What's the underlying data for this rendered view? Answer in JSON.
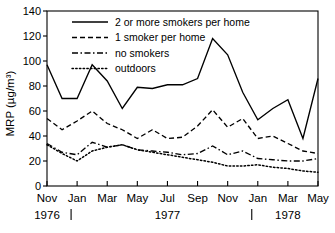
{
  "chart_data": {
    "type": "line",
    "title": "",
    "xlabel": "",
    "ylabel": "MRP (µg/m³)",
    "ylim": [
      0,
      140
    ],
    "yticks": [
      0,
      20,
      40,
      60,
      80,
      100,
      120,
      140
    ],
    "grid": false,
    "legend_position": "top-center",
    "x_month_index_range": [
      0,
      18
    ],
    "x_tick_labels": [
      "Nov",
      "Jan",
      "Mar",
      "May",
      "Jul",
      "Sep",
      "Nov",
      "Jan",
      "Mar",
      "May"
    ],
    "x_tick_month_index": [
      0,
      2,
      4,
      6,
      8,
      10,
      12,
      14,
      16,
      18
    ],
    "year_labels": [
      {
        "text": "1976",
        "month_index": 0
      },
      {
        "text": "1977",
        "month_index": 8
      },
      {
        "text": "1978",
        "month_index": 16
      }
    ],
    "year_separator_month_index": [
      1.6,
      13.6
    ],
    "series": [
      {
        "name": "2 or more smokers per home",
        "style": "solid",
        "x": [
          0,
          1,
          2,
          3,
          4,
          5,
          6,
          7,
          8,
          9,
          10,
          11,
          12,
          13,
          14,
          15,
          16,
          17,
          18
        ],
        "values": [
          97,
          70,
          70,
          97,
          84,
          62,
          79,
          78,
          81,
          81,
          86,
          118,
          105,
          75,
          53,
          62,
          69,
          38,
          86
        ]
      },
      {
        "name": "1 smoker per home",
        "style": "dashed",
        "x": [
          0,
          1,
          2,
          3,
          4,
          5,
          6,
          7,
          8,
          9,
          10,
          11,
          12,
          13,
          14,
          15,
          16,
          17,
          18
        ],
        "values": [
          54,
          45,
          52,
          60,
          50,
          45,
          38,
          45,
          38,
          39,
          48,
          61,
          47,
          54,
          38,
          40,
          34,
          28,
          26
        ]
      },
      {
        "name": "no smokers",
        "style": "dash-dot",
        "x": [
          0,
          1,
          2,
          3,
          4,
          5,
          6,
          7,
          8,
          9,
          10,
          11,
          12,
          13,
          14,
          15,
          16,
          17,
          18
        ],
        "values": [
          34,
          27,
          25,
          35,
          31,
          33,
          29,
          28,
          27,
          25,
          26,
          32,
          25,
          28,
          22,
          21,
          20,
          20,
          22
        ]
      },
      {
        "name": "outdoors",
        "style": "dotted",
        "x": [
          0,
          1,
          2,
          3,
          4,
          5,
          6,
          7,
          8,
          9,
          10,
          11,
          12,
          13,
          14,
          15,
          16,
          17,
          18
        ],
        "values": [
          33,
          26,
          20,
          28,
          31,
          33,
          29,
          27,
          25,
          23,
          21,
          19,
          16,
          16,
          17,
          15,
          14,
          12,
          11
        ]
      }
    ],
    "legend": [
      {
        "label": "2 or more smokers per home",
        "style": "solid"
      },
      {
        "label": "1 smoker per home",
        "style": "dashed"
      },
      {
        "label": "no smokers",
        "style": "dash-dot"
      },
      {
        "label": "outdoors",
        "style": "dotted"
      }
    ]
  }
}
